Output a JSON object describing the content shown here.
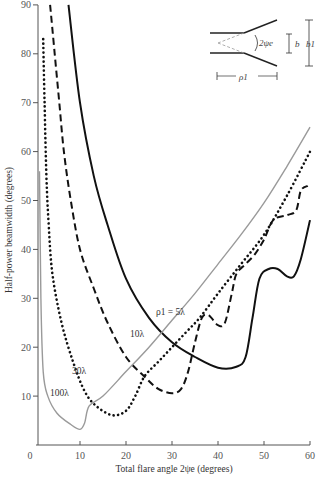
{
  "chart_data": {
    "type": "line",
    "title": "",
    "xlabel": "Total flare angle 2ψe (degrees)",
    "ylabel": "Half-power beamwidth (degrees)",
    "xlim": [
      0,
      60
    ],
    "ylim": [
      0,
      90
    ],
    "xticks": [
      0,
      10,
      20,
      30,
      40,
      50,
      60
    ],
    "yticks": [
      10,
      20,
      30,
      40,
      50,
      60,
      70,
      80,
      90
    ],
    "grid": false,
    "legend": "inline curve labels",
    "series": [
      {
        "name": "ρ1 = 5λ",
        "label": "ρ1 = 5λ",
        "style": "solid",
        "color": "#111111",
        "x": [
          7.5,
          10,
          13,
          16,
          20,
          25,
          30,
          35,
          40,
          44,
          46,
          47.5,
          49,
          51,
          53,
          55,
          56.5,
          58,
          60
        ],
        "y": [
          90,
          70,
          55,
          45,
          34,
          26,
          21,
          18,
          15.8,
          16,
          18,
          26,
          34,
          36,
          36,
          34.5,
          34.5,
          38,
          46
        ]
      },
      {
        "name": "10λ",
        "label": "10λ",
        "style": "dashed",
        "color": "#111111",
        "x": [
          3.5,
          4.5,
          5.5,
          6.5,
          8,
          10,
          13,
          16,
          20,
          24,
          27,
          30,
          32,
          33.5,
          35,
          36.5,
          38,
          40,
          41.5,
          43,
          44,
          46,
          48,
          50,
          52,
          55,
          57,
          58,
          59.5
        ],
        "y": [
          90,
          80,
          70,
          60,
          50,
          40,
          32,
          25,
          18,
          14,
          11.5,
          10.6,
          11.5,
          15,
          21,
          26,
          26.5,
          24.5,
          25,
          31,
          35,
          37,
          39,
          42,
          46,
          47,
          48,
          52,
          53
        ]
      },
      {
        "name": "30λ",
        "label": "30λ",
        "style": "dotted",
        "color": "#111111",
        "x": [
          2,
          2.3,
          2.7,
          3.2,
          4,
          6,
          8.5,
          11,
          13.5,
          17,
          20,
          22,
          24,
          27,
          30,
          33,
          36,
          40,
          45,
          50,
          55,
          60
        ],
        "y": [
          83,
          70,
          55,
          45,
          35,
          25,
          17,
          11,
          8,
          6.1,
          7,
          10,
          14,
          17,
          20,
          23,
          26,
          31,
          37,
          43,
          51,
          60
        ]
      },
      {
        "name": "100λ",
        "label": "100λ",
        "style": "solid-gray",
        "color": "#9a9a9a",
        "x": [
          1.2,
          1.5,
          2,
          3,
          5,
          8,
          10,
          11,
          12,
          15,
          20,
          25,
          30,
          35,
          40,
          45,
          50,
          55,
          60
        ],
        "y": [
          56,
          30,
          15,
          10,
          6.5,
          4.2,
          3.2,
          4.5,
          8,
          10,
          15,
          20,
          25.5,
          31,
          37,
          43,
          49.5,
          57,
          65
        ]
      }
    ],
    "annotations": [
      {
        "text": "ρ1 = 5λ",
        "x": 33,
        "y": 27
      },
      {
        "text": "10λ",
        "x": 20.5,
        "y": 22
      },
      {
        "text": "30λ",
        "x": 11,
        "y": 15.5
      },
      {
        "text": "100λ",
        "x": 4.5,
        "y": 10
      }
    ],
    "inset": {
      "description": "E-plane sectoral horn geometry",
      "labels": {
        "angle": "2ψe",
        "b": "b",
        "b1": "b1",
        "rho1": "ρ1"
      }
    }
  },
  "axis": {
    "x_title": "Total flare angle 2ψe (degrees)",
    "y_title": "Half-power beamwidth (degrees)",
    "x_ticks": [
      "0",
      "10",
      "20",
      "30",
      "40",
      "50",
      "60"
    ],
    "y_ticks": [
      "10",
      "20",
      "30",
      "40",
      "50",
      "60",
      "70",
      "80",
      "90"
    ]
  },
  "labels": {
    "rho5": "ρ1 = 5λ",
    "l10": "10λ",
    "l30": "30λ",
    "l100": "100λ"
  },
  "inset": {
    "angle": "2ψe",
    "b": "b",
    "b1": "b1",
    "rho1": "ρ1"
  }
}
